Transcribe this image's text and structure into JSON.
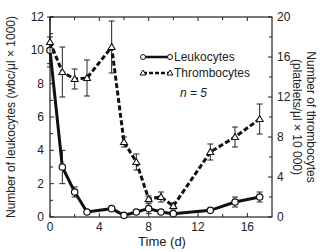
{
  "chart_data": {
    "type": "line",
    "title": "",
    "xlabel": "Time (d)",
    "ylabel": "Number of leukocytes (wbc/μl × 1000)",
    "y2label_line1": "Number of thrombocytes",
    "y2label_line2": "(platelets/μl × 10 000)",
    "xlim": [
      0,
      18
    ],
    "ylim": [
      0,
      12
    ],
    "y2lim": [
      0,
      20
    ],
    "x_ticks": [
      0,
      4,
      8,
      12,
      16
    ],
    "y_ticks": [
      0,
      2,
      4,
      6,
      8,
      10,
      12
    ],
    "y2_ticks": [
      0,
      4,
      8,
      12,
      16,
      20
    ],
    "annotation": "n = 5",
    "legend_position": "upper right inside",
    "series": [
      {
        "name": "Leukocytes",
        "axis": "left",
        "style": "solid, open circles",
        "x": [
          0,
          1,
          2,
          3,
          5,
          6,
          7,
          8,
          9,
          10,
          13,
          15,
          17
        ],
        "values": [
          10.0,
          3.0,
          1.5,
          0.3,
          0.5,
          0.1,
          0.3,
          0.5,
          0.3,
          0.2,
          0.4,
          0.9,
          1.2
        ],
        "error": [
          0.8,
          1.0,
          0.3,
          0.1,
          0.1,
          0.1,
          0.1,
          0.3,
          0.1,
          0.1,
          0.1,
          0.3,
          0.3
        ]
      },
      {
        "name": "Thrombocytes",
        "axis": "right",
        "style": "dashed, open triangles",
        "x": [
          0,
          1,
          2,
          3,
          5,
          6,
          7,
          8,
          9,
          10,
          13,
          15,
          17
        ],
        "values": [
          17.5,
          14.5,
          13.8,
          13.9,
          17.0,
          7.5,
          5.5,
          1.8,
          2.0,
          1.1,
          6.5,
          8.0,
          9.8
        ],
        "error": [
          2.5,
          2.5,
          1.0,
          1.8,
          2.6,
          0.5,
          0.8,
          0.3,
          0.5,
          0.3,
          0.8,
          1.0,
          1.5
        ]
      }
    ]
  }
}
